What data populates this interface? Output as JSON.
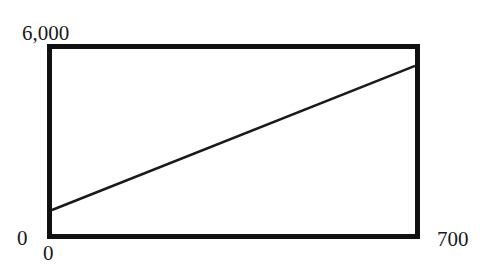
{
  "chart_data": {
    "type": "line",
    "title": "",
    "xlabel": "",
    "ylabel": "",
    "xlim": [
      0,
      700
    ],
    "ylim": [
      0,
      6000
    ],
    "grid": false,
    "legend": null,
    "x_tick_labels": [
      "0",
      "700"
    ],
    "y_tick_labels": [
      "0",
      "6,000"
    ],
    "series": [
      {
        "name": "line",
        "x": [
          0,
          700
        ],
        "y": [
          750,
          5450
        ]
      }
    ]
  },
  "labels": {
    "y_max": "6,000",
    "y_min": "0",
    "x_min": "0",
    "x_max": "700"
  },
  "colors": {
    "frame": "#111111",
    "line": "#1a1a1a"
  }
}
